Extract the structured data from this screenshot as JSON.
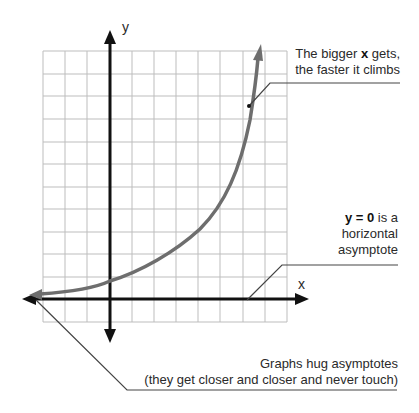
{
  "axes": {
    "x_label": "x",
    "y_label": "y"
  },
  "annotations": {
    "climb": {
      "line1_pre": "The bigger ",
      "line1_bold": "x",
      "line1_post": " gets,",
      "line2": "the faster it climbs"
    },
    "asymptote": {
      "line1_bold": "y = 0",
      "line1_post": " is a",
      "line2": "horizontal",
      "line3": "asymptote"
    },
    "hug": {
      "line1": "Graphs hug asymptotes",
      "line2": "(they get closer and closer and never touch)"
    }
  },
  "colors": {
    "grid": "#bdbdbd",
    "axis": "#111111",
    "curve": "#6e6e6e",
    "text": "#2a2a2a"
  }
}
